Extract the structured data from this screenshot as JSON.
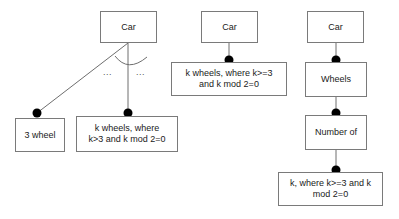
{
  "diagram": {
    "background_color": "#ffffff",
    "line_color": "#555555",
    "box_border_color": "#7a7a7a",
    "dot_color": "#000000",
    "text_color": "#1a1a1a",
    "groups": [
      {
        "id": "group-left",
        "nodes": [
          {
            "id": "left-car",
            "label": "Car"
          },
          {
            "id": "left-three-wheel",
            "label": "3 wheel"
          },
          {
            "id": "left-k-wheels",
            "label": "k wheels, where\nk>3 and k mod 2=0"
          }
        ],
        "ellipses": [
          {
            "id": "ellipsis-left",
            "label": "..."
          },
          {
            "id": "ellipsis-right",
            "label": "..."
          }
        ]
      },
      {
        "id": "group-middle",
        "nodes": [
          {
            "id": "middle-car",
            "label": "Car"
          },
          {
            "id": "middle-k-wheels",
            "label": "k wheels, where k>=3\nand k mod 2=0"
          }
        ]
      },
      {
        "id": "group-right",
        "nodes": [
          {
            "id": "right-car",
            "label": "Car"
          },
          {
            "id": "right-wheels",
            "label": "Wheels"
          },
          {
            "id": "right-number-of",
            "label": "Number of"
          },
          {
            "id": "right-k-constraint",
            "label": "k, where k>=3 and k\nmod 2=0"
          }
        ]
      }
    ]
  }
}
